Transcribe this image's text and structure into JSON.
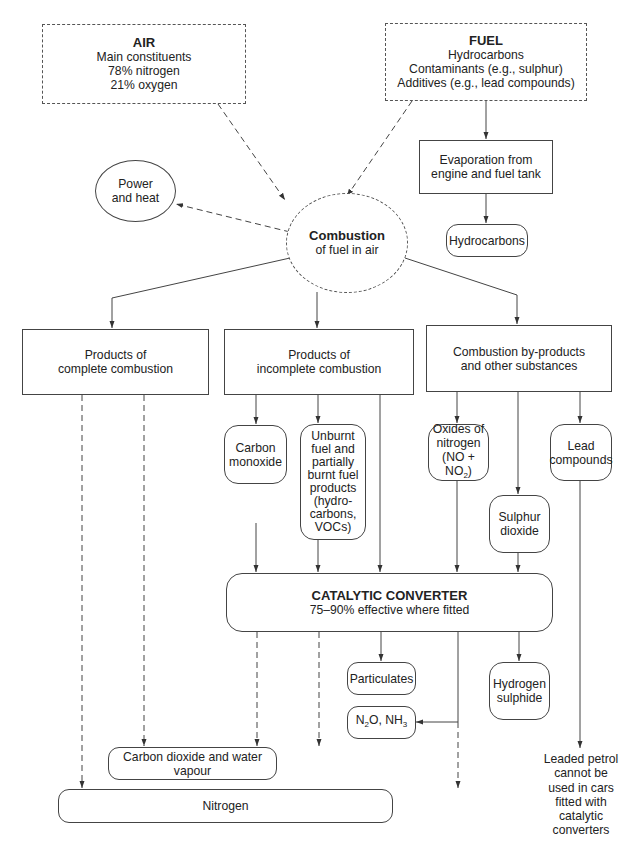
{
  "diagram": {
    "air": {
      "title": "AIR",
      "lines": [
        "Main constituents",
        "78% nitrogen",
        "21% oxygen"
      ]
    },
    "fuel": {
      "title": "FUEL",
      "lines": [
        "Hydrocarbons",
        "Contaminants (e.g., sulphur)",
        "Additives (e.g., lead compounds)"
      ]
    },
    "evaporation": {
      "lines": [
        "Evaporation from",
        "engine and fuel tank"
      ]
    },
    "hydrocarbons": {
      "label": "Hydrocarbons"
    },
    "power_heat": {
      "lines": [
        "Power",
        "and heat"
      ]
    },
    "combustion": {
      "title": "Combustion",
      "subtitle": "of fuel in air"
    },
    "complete": {
      "lines": [
        "Products of",
        "complete combustion"
      ]
    },
    "incomplete": {
      "lines": [
        "Products of",
        "incomplete combustion"
      ]
    },
    "byproducts": {
      "lines": [
        "Combustion by-products",
        "and other substances"
      ]
    },
    "carbon_monoxide": {
      "lines": [
        "Carbon",
        "monoxide"
      ]
    },
    "unburnt": {
      "lines": [
        "Unburnt",
        "fuel and",
        "partially",
        "burnt fuel",
        "products",
        "(hydro-",
        "carbons,",
        "VOCs)"
      ]
    },
    "nox": {
      "line1": "Oxides of",
      "line2": "nitrogen",
      "line3_pre": "(NO + NO",
      "line3_sub": "2",
      "line3_post": ")"
    },
    "lead": {
      "lines": [
        "Lead",
        "compounds"
      ]
    },
    "sulphur": {
      "lines": [
        "Sulphur",
        "dioxide"
      ]
    },
    "catalytic": {
      "title": "CATALYTIC CONVERTER",
      "subtitle": "75–90% effective where fitted"
    },
    "particulates": {
      "label": "Particulates"
    },
    "hydrogen_sulphide": {
      "lines": [
        "Hydrogen",
        "sulphide"
      ]
    },
    "n2o_nh3": {
      "a_pre": "N",
      "a_sub": "2",
      "a_post": "O,  NH",
      "b_sub": "3"
    },
    "co2_water": {
      "label": "Carbon dioxide and water vapour"
    },
    "nitrogen": {
      "label": "Nitrogen"
    },
    "leaded_note": {
      "lines": [
        "Leaded petrol",
        "cannot be",
        "used in cars",
        "fitted with",
        "catalytic",
        "converters"
      ]
    }
  },
  "colors": {
    "line": "#444444",
    "text": "#222222",
    "background": "#ffffff"
  }
}
